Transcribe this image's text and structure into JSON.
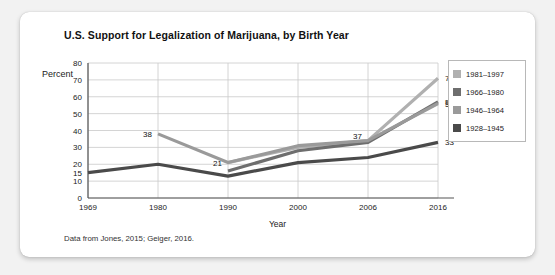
{
  "card": {
    "title": "U.S. Support for Legalization of Marijuana, by Birth Year",
    "footnote": "Data from Jones, 2015; Geiger, 2016."
  },
  "legend": {
    "items": [
      {
        "label": "1981–1997",
        "color": "#b0b0b0"
      },
      {
        "label": "1966–1980",
        "color": "#6e6e6e"
      },
      {
        "label": "1946–1964",
        "color": "#9a9a9a"
      },
      {
        "label": "1928–1945",
        "color": "#4a4a4a"
      }
    ]
  },
  "chart_data": {
    "type": "line",
    "title": "U.S. Support for Legalization of Marijuana, by Birth Year",
    "xlabel": "Year",
    "ylabel": "Percent",
    "categories": [
      "1969",
      "1980",
      "1990",
      "2000",
      "2006",
      "2016"
    ],
    "ylim": [
      0,
      80
    ],
    "yticks": [
      0,
      10,
      20,
      30,
      40,
      50,
      60,
      70,
      80
    ],
    "grid": true,
    "legend_position": "right",
    "series": [
      {
        "name": "1981–1997",
        "color": "#b0b0b0",
        "values": [
          null,
          null,
          21,
          30,
          34,
          71
        ]
      },
      {
        "name": "1966–1980",
        "color": "#6e6e6e",
        "values": [
          null,
          null,
          16,
          28,
          33,
          57
        ]
      },
      {
        "name": "1946–1964",
        "color": "#9a9a9a",
        "values": [
          null,
          38,
          21,
          31,
          34,
          56
        ]
      },
      {
        "name": "1928–1945",
        "color": "#4a4a4a",
        "values": [
          15,
          20,
          13,
          21,
          24,
          33
        ]
      }
    ],
    "point_labels": [
      {
        "text": "15",
        "x": "1969",
        "y": 15
      },
      {
        "text": "38",
        "x": "1980",
        "y": 38
      },
      {
        "text": "21",
        "x": "1990",
        "y": 21
      },
      {
        "text": "37",
        "x": "2006",
        "y": 37
      },
      {
        "text": "71",
        "x": "2016",
        "y": 71
      },
      {
        "text": "57",
        "x": "2016",
        "y": 57
      },
      {
        "text": "56",
        "x": "2016",
        "y": 56
      },
      {
        "text": "33",
        "x": "2016",
        "y": 33
      }
    ]
  }
}
